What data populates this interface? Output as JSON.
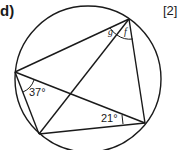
{
  "question": {
    "part_label": "d)",
    "marks": "[2]"
  },
  "diagram": {
    "angles": {
      "left_vertex": "37°",
      "right_vertex": "21°",
      "top_vertex_left": "g",
      "top_vertex_right": "f"
    }
  }
}
